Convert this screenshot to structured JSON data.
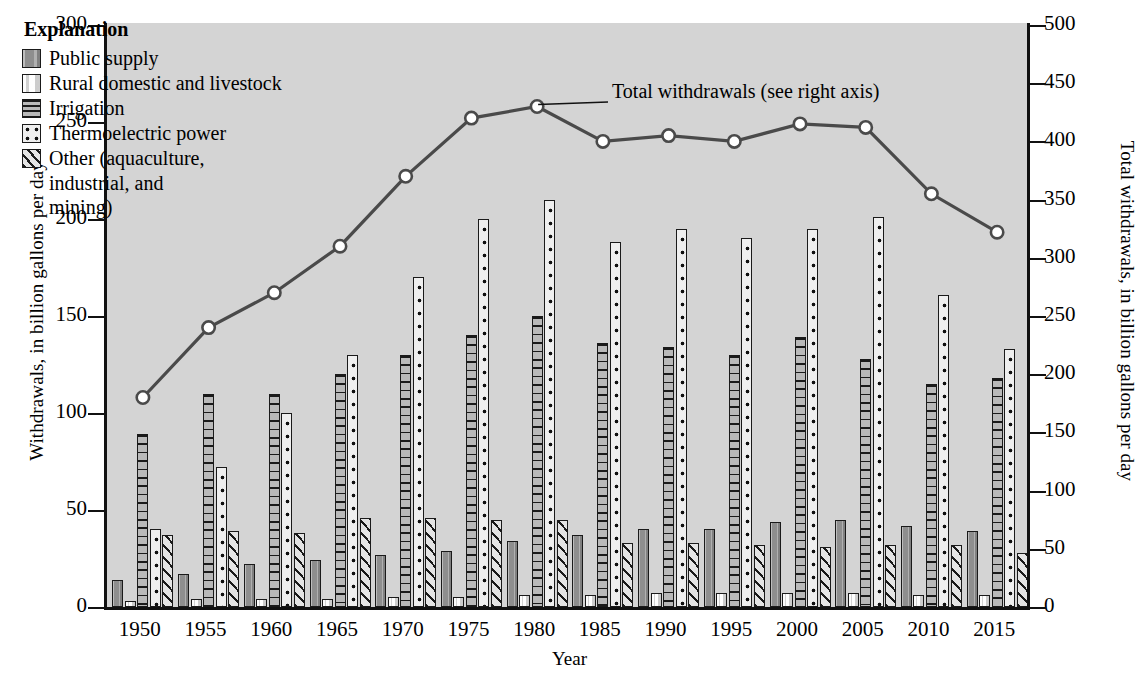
{
  "chart_data": {
    "type": "bar",
    "title": "",
    "xlabel": "Year",
    "ylabel": "Withdrawals, in billion gallons per day",
    "ylabel_right": "Total withdrawals, in billion gallons per day",
    "ylim": [
      0,
      300
    ],
    "ylim_right": [
      0,
      500
    ],
    "yticks": [
      0,
      50,
      100,
      150,
      200,
      250,
      300
    ],
    "yticks_right": [
      0,
      50,
      100,
      150,
      200,
      250,
      300,
      350,
      400,
      450,
      500
    ],
    "grid": false,
    "legend_position": "upper-left",
    "legend_title": "Explanation",
    "categories": [
      "1950",
      "1955",
      "1960",
      "1965",
      "1970",
      "1975",
      "1980",
      "1985",
      "1990",
      "1995",
      "2000",
      "2005",
      "2010",
      "2015"
    ],
    "series": [
      {
        "name": "Public supply",
        "pattern": "solid-gray",
        "values": [
          14,
          17,
          22,
          24,
          27,
          29,
          34,
          37,
          40,
          40,
          44,
          45,
          42,
          39
        ]
      },
      {
        "name": "Rural domestic and livestock",
        "pattern": "light-blank",
        "values": [
          3,
          4,
          4,
          4,
          5,
          5,
          6,
          6,
          7,
          7,
          7,
          7,
          6,
          6
        ]
      },
      {
        "name": "Irrigation",
        "pattern": "horizontal-lines",
        "values": [
          89,
          110,
          110,
          120,
          130,
          140,
          150,
          136,
          134,
          130,
          139,
          128,
          115,
          118
        ]
      },
      {
        "name": "Thermoelectric power",
        "pattern": "dotted",
        "values": [
          40,
          72,
          100,
          130,
          170,
          200,
          210,
          188,
          195,
          190,
          195,
          201,
          161,
          133
        ]
      },
      {
        "name": "Other (aquaculture, industrial, and mining)",
        "pattern": "diagonal-hatch",
        "values": [
          37,
          39,
          38,
          46,
          46,
          45,
          45,
          33,
          33,
          32,
          31,
          32,
          32,
          28
        ]
      }
    ],
    "line_series": {
      "name": "Total withdrawals (see right axis)",
      "axis": "right",
      "marker": "open-circle",
      "values": [
        180,
        240,
        270,
        310,
        370,
        420,
        430,
        400,
        405,
        400,
        415,
        412,
        355,
        322
      ]
    },
    "annotation": "Total withdrawals (see right axis)"
  },
  "legend": {
    "title": "Explanation",
    "items": [
      {
        "label": "Public supply",
        "cont": ""
      },
      {
        "label": "Rural domestic and livestock",
        "cont": ""
      },
      {
        "label": "Irrigation",
        "cont": ""
      },
      {
        "label": "Thermoelectric power",
        "cont": ""
      },
      {
        "label": "Other (aquaculture,",
        "cont": "industrial, and"
      },
      {
        "label": "mining)",
        "cont": ""
      }
    ],
    "line5_a": "Other (aquaculture,",
    "line5_b": "industrial, and",
    "line5_c": "mining)"
  }
}
